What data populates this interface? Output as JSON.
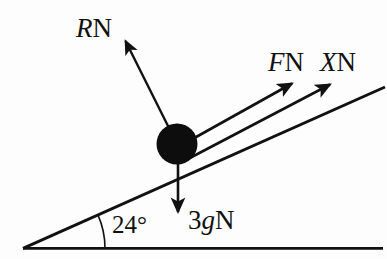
{
  "figure": {
    "type": "free-body-diagram",
    "background_color": "#fdfdfd",
    "ink_color": "#111111",
    "width": 387,
    "height": 259
  },
  "labels": {
    "normal_force": {
      "symbol": "R",
      "unit": "N",
      "full": "RN"
    },
    "applied_force": {
      "symbol": "F",
      "unit": "N",
      "full": "FN"
    },
    "second_force": {
      "symbol": "X",
      "unit": "N",
      "full": "XN"
    },
    "weight": {
      "coefficient": "3",
      "symbol": "g",
      "unit": "N",
      "full": "3gN"
    },
    "angle": {
      "value": "24",
      "degree_sign": "°",
      "full": "24°"
    }
  },
  "geometry": {
    "incline_angle_deg": 24,
    "vertex": {
      "x": 23,
      "y": 248
    },
    "baseline_end": {
      "x": 383,
      "y": 248
    },
    "incline_end": {
      "x": 385,
      "y": 85
    },
    "particle": {
      "cx": 177,
      "cy": 144,
      "r": 20
    },
    "arc": {
      "radius": 82,
      "start_angle_deg": 0,
      "end_angle_deg": 24
    }
  },
  "vectors": [
    {
      "name": "normal-reaction",
      "label": "RN",
      "from": {
        "x": 177,
        "y": 144
      },
      "to": {
        "x": 124,
        "y": 38
      },
      "direction": "up-left perpendicular to incline"
    },
    {
      "name": "applied-force",
      "label": "FN",
      "from": {
        "x": 177,
        "y": 144
      },
      "to": {
        "x": 290,
        "y": 83
      },
      "direction": "up the slope"
    },
    {
      "name": "second-force",
      "label": "XN",
      "from": {
        "x": 196,
        "y": 155
      },
      "to": {
        "x": 328,
        "y": 84
      },
      "direction": "up the slope along plane"
    },
    {
      "name": "weight",
      "label": "3gN",
      "from": {
        "x": 178,
        "y": 150
      },
      "to": {
        "x": 178,
        "y": 216
      },
      "direction": "vertically downward"
    }
  ]
}
